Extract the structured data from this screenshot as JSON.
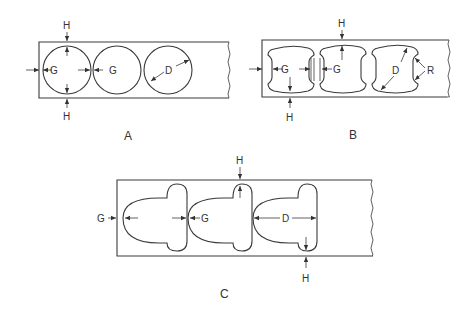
{
  "figure": {
    "panels": [
      {
        "id": "A",
        "caption": "A",
        "hole_shape": "circle",
        "labels": {
          "gap_1": "G",
          "gap_2": "G",
          "diameter": "D",
          "height_top": "H",
          "height_bottom": "H"
        }
      },
      {
        "id": "B",
        "caption": "B",
        "hole_shape": "barrel (concave sides, rounded corners)",
        "labels": {
          "gap_1": "G",
          "gap_2": "G",
          "diameter": "D",
          "radius": "R",
          "height_top": "H",
          "height_bottom": "H"
        }
      },
      {
        "id": "C",
        "caption": "C",
        "hole_shape": "half-round with lobed end",
        "labels": {
          "gap_1": "G",
          "gap_2": "G",
          "diameter": "D",
          "height_top": "H",
          "height_bottom": "H"
        }
      }
    ],
    "colors": {
      "line": "#3a3a3a",
      "background": "#ffffff"
    }
  }
}
